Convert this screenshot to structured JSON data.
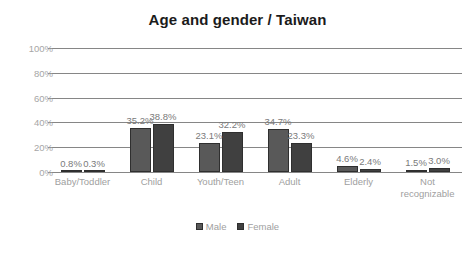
{
  "chart_data": {
    "type": "bar",
    "title": "Age and gender / Taiwan",
    "xlabel": "",
    "ylabel": "",
    "ylim": [
      0,
      100
    ],
    "ytick_labels": [
      "100%",
      "80%",
      "60%",
      "40%",
      "20%",
      "0%"
    ],
    "ytick_values": [
      100,
      80,
      60,
      40,
      20,
      0
    ],
    "grid": "horizontal",
    "legend_position": "bottom",
    "categories": [
      "Baby/Toddler",
      "Child",
      "Youth/Teen",
      "Adult",
      "Elderly",
      "Not recognizable"
    ],
    "series": [
      {
        "name": "Male",
        "color": "#595959",
        "values": [
          0.8,
          35.2,
          23.1,
          34.7,
          4.6,
          1.5
        ],
        "labels": [
          "0.8%",
          "35.2%",
          "23.1%",
          "34.7%",
          "4.6%",
          "1.5%"
        ]
      },
      {
        "name": "Female",
        "color": "#404040",
        "values": [
          0.3,
          38.8,
          32.2,
          23.3,
          2.4,
          3.0
        ],
        "labels": [
          "0.3%",
          "38.8%",
          "32.2%",
          "23.3%",
          "2.4%",
          "3.0%"
        ]
      }
    ]
  }
}
